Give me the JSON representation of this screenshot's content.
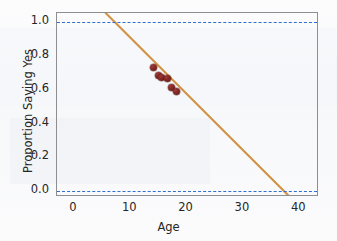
{
  "chart_data": {
    "type": "scatter",
    "title": "",
    "xlabel": "Age",
    "ylabel": "Proportion Saying Yes",
    "xlim": [
      -3,
      43.5
    ],
    "ylim": [
      -0.035,
      1.055
    ],
    "xticks": [
      0,
      10,
      20,
      30,
      40
    ],
    "xtick_labels": [
      "0",
      "10",
      "20",
      "30",
      "40"
    ],
    "yticks": [
      0.0,
      0.2,
      0.4,
      0.6,
      0.8,
      1.0
    ],
    "ytick_labels": [
      "0.0",
      "0.2",
      "0.4",
      "0.6",
      "0.8",
      "1.0"
    ],
    "grid": false,
    "legend": "none",
    "points": [
      {
        "x": 14.2,
        "y": 0.73
      },
      {
        "x": 15.0,
        "y": 0.685
      },
      {
        "x": 15.6,
        "y": 0.675
      },
      {
        "x": 16.7,
        "y": 0.665
      },
      {
        "x": 17.3,
        "y": 0.615
      },
      {
        "x": 18.2,
        "y": 0.59
      }
    ],
    "fit_line": {
      "name": "least-squares regression line",
      "x_start": 5.7,
      "y_start": 1.055,
      "x_end": 38.3,
      "y_end": -0.035,
      "slope": -0.0334,
      "intercept": 1.245,
      "color": "#d29243"
    },
    "reference_lines": [
      {
        "name": "upper-bound",
        "y": 1.0,
        "style": "dashed",
        "color": "#2f6fcf"
      },
      {
        "name": "lower-bound",
        "y": 0.0,
        "style": "dashed",
        "color": "#2f6fcf"
      }
    ],
    "colors": {
      "point": "#7c2320",
      "line": "#d29243",
      "reference": "#2f6fcf",
      "frame": "#8e8e92",
      "text": "#262626",
      "background": "#fdfdfd"
    }
  }
}
